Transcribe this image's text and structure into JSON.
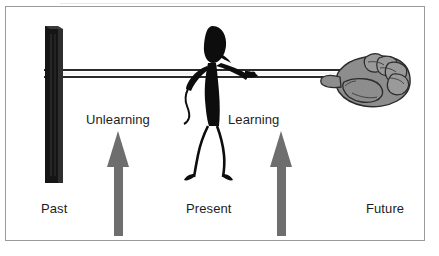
{
  "diagram": {
    "timeline_labels": {
      "past": "Past",
      "present": "Present",
      "future": "Future"
    },
    "arrows": [
      {
        "id": "unlearning",
        "label": "Unlearning",
        "direction": "up",
        "color": "#6e6e6e"
      },
      {
        "id": "learning",
        "label": "Learning",
        "direction": "up",
        "color": "#6e6e6e"
      }
    ],
    "figures": {
      "post": {
        "name": "past-post",
        "color": "#151515"
      },
      "stick_figure": {
        "name": "stick-figure-person",
        "color": "#0d0d0d"
      },
      "hand": {
        "name": "future-hand",
        "fill": "#8d8d8d",
        "outline": "#2b2b2b"
      },
      "rope": {
        "name": "timeline-rope",
        "color": "#2a2a2a"
      }
    },
    "colors": {
      "background": "#ffffff",
      "frame_border": "#9a9a9a",
      "text": "#1d1d1d",
      "arrow_gray": "#6e6e6e",
      "hand_gray": "#8d8d8d",
      "dark": "#151515"
    }
  }
}
